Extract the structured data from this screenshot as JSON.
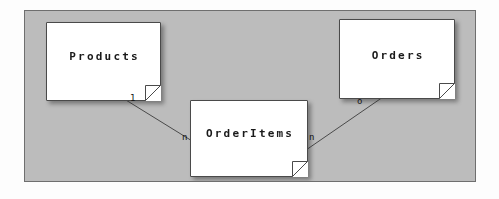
{
  "diagram": {
    "type": "entity-relationship-notes",
    "canvas_color": "#bcbcbc",
    "note_color": "#ffffff",
    "line_color": "#4a4a4a",
    "text_color": "#1a1a1a",
    "notes": [
      {
        "id": "products",
        "label": "Products"
      },
      {
        "id": "orderitems",
        "label": "OrderItems"
      },
      {
        "id": "orders",
        "label": "Orders"
      }
    ],
    "relationships": [
      {
        "from": "products",
        "to": "orderitems",
        "from_cardinality": "1",
        "to_cardinality": "n"
      },
      {
        "from": "orderitems",
        "to": "orders",
        "from_cardinality": "n",
        "to_cardinality": "o"
      }
    ]
  }
}
